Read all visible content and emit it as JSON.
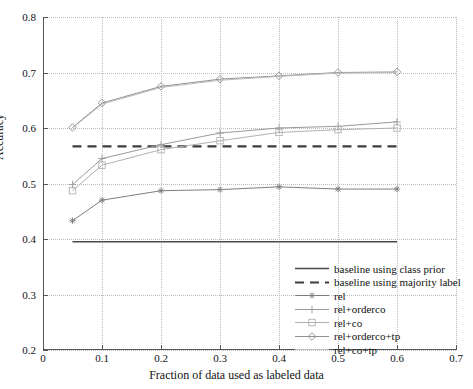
{
  "chart_data": {
    "type": "line",
    "title": "",
    "xlabel": "Fraction of data used as labeled data",
    "ylabel": "Accuracy",
    "xlim": [
      0.0,
      0.7
    ],
    "ylim": [
      0.2,
      0.8
    ],
    "xticks": [
      "0",
      "0.1",
      "0.2",
      "0.3",
      "0.4",
      "0.5",
      "0.6",
      "0.7"
    ],
    "xtick_values": [
      0.0,
      0.1,
      0.2,
      0.3,
      0.4,
      0.5,
      0.6,
      0.7
    ],
    "yticks": [
      "0.2",
      "0.3",
      "0.4",
      "0.5",
      "0.6",
      "0.7",
      "0.8"
    ],
    "ytick_values": [
      0.2,
      0.3,
      0.4,
      0.5,
      0.6,
      0.7,
      0.8
    ],
    "grid": true,
    "legend_position": "lower right",
    "x": [
      0.05,
      0.1,
      0.2,
      0.3,
      0.4,
      0.5,
      0.6
    ],
    "series": [
      {
        "name": "baseline using class prior",
        "type": "hline",
        "value": 0.395,
        "style": "solid",
        "marker": "none",
        "color": "#4a4a4a",
        "width": 1.6
      },
      {
        "name": "baseline using majority label",
        "type": "hline",
        "value": 0.567,
        "style": "dashed",
        "marker": "none",
        "color": "#3d3d3d",
        "width": 2.2
      },
      {
        "name": "rel",
        "type": "line",
        "values": [
          0.433,
          0.47,
          0.487,
          0.489,
          0.494,
          0.49,
          0.49
        ],
        "style": "solid",
        "marker": "star",
        "color": "#7e7e7e",
        "width": 1.0
      },
      {
        "name": "rel+orderco",
        "type": "line",
        "values": [
          0.498,
          0.545,
          0.57,
          0.591,
          0.6,
          0.603,
          0.611
        ],
        "style": "solid",
        "marker": "plus",
        "color": "#9a9a9a",
        "width": 1.0
      },
      {
        "name": "rel+co",
        "type": "line",
        "values": [
          0.487,
          0.533,
          0.561,
          0.577,
          0.592,
          0.597,
          0.6
        ],
        "style": "solid",
        "marker": "square",
        "color": "#b0b0b0",
        "width": 1.0
      },
      {
        "name": "rel+orderco+tp",
        "type": "line",
        "values": [
          0.601,
          0.645,
          0.675,
          0.688,
          0.694,
          0.7,
          0.701
        ],
        "style": "solid",
        "marker": "diamond",
        "color": "#8f8f8f",
        "width": 1.0
      },
      {
        "name": "rel+co+tp",
        "type": "line",
        "values": [
          0.6,
          0.643,
          0.673,
          0.686,
          0.693,
          0.699,
          0.7
        ],
        "style": "solid",
        "marker": "none",
        "color": "#bcbcbc",
        "width": 1.0
      }
    ]
  },
  "axis": {
    "y_title": "Accuracy",
    "x_title": "Fraction of data used as labeled data"
  },
  "legend": {
    "items": [
      {
        "label": "baseline using class prior"
      },
      {
        "label": "baseline using majority label"
      },
      {
        "label": "rel"
      },
      {
        "label": "rel+orderco"
      },
      {
        "label": "rel+co"
      },
      {
        "label": "rel+orderco+tp"
      },
      {
        "label": "rel+co+tp"
      }
    ]
  }
}
